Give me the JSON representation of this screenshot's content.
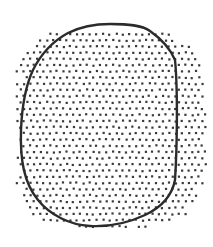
{
  "image": {
    "width": 213,
    "height": 247,
    "background": "#ffffff",
    "description": "Stippled rounded blob with an irregular oval outline drawn over it"
  },
  "stipple": {
    "dot_color": "#3a3a3a",
    "dot_size": 2.2,
    "spacing_x": 6.6,
    "spacing_y": 6.2,
    "region": {
      "cx": 110,
      "cy": 128,
      "rx": 96,
      "ry": 100,
      "corner_softness": 0.82
    }
  },
  "outline": {
    "stroke": "#2b2b2b",
    "stroke_width": 2.4,
    "path": "M 110 24 C 128 24 142 25 150 31 C 160 38 170 48 175 60 C 178 90 177 150 175 180 C 172 196 160 208 145 215 C 128 223 108 227 90 226 C 70 225 50 215 38 200 C 24 183 20 160 21 130 C 22 105 26 85 33 70 C 42 52 55 40 68 33 C 80 27 95 24 110 24 Z"
  }
}
